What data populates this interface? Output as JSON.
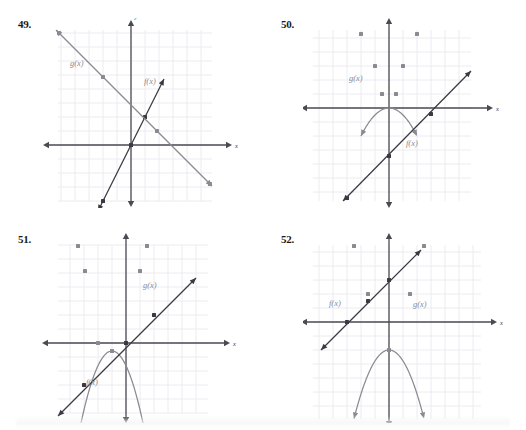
{
  "page": {
    "background": "#ffffff",
    "grid_color": "#eceaf0",
    "axis_color": "#4a4a52",
    "curve_dark": "#3a3a42",
    "curve_gray": "#8a8a92",
    "label_color": "#8a8a92",
    "number_color": "#1a1a1a"
  },
  "panels": [
    {
      "id": "panel-49",
      "number": "49.",
      "number_pos": {
        "x": 18,
        "y": 18
      },
      "graph_pos": {
        "x": 40,
        "y": 18
      },
      "graph_size": {
        "w": 200,
        "h": 190
      },
      "axis": {
        "x_label": "x",
        "y_label": "y",
        "origin": {
          "x": 91,
          "y": 127
        },
        "cell": 14,
        "grid": {
          "left": 18,
          "right": 172,
          "top": 12,
          "bottom": 183
        },
        "x_axis": {
          "x1": 7,
          "x2": 188,
          "y": 127
        },
        "y_axis": {
          "y1": 6,
          "y2": 185,
          "x": 91
        }
      },
      "curves": [
        {
          "name": "f(x)",
          "type": "line",
          "color": "#3a3a42",
          "label_pos": {
            "x": 104,
            "y": 66
          },
          "points_data": [
            [
              -2,
              -4
            ],
            [
              -1,
              -2
            ],
            [
              0,
              0
            ],
            [
              1,
              2
            ],
            [
              2,
              4
            ]
          ],
          "plot_points": [
            [
              63,
              183
            ],
            [
              77,
              155
            ],
            [
              91,
              127
            ],
            [
              105,
              99
            ],
            [
              119,
              71
            ]
          ],
          "arrow_start": [
            58,
            193
          ],
          "arrow_end": [
            124,
            61
          ],
          "markers": [
            [
              63,
              183
            ],
            [
              91,
              127
            ],
            [
              105,
              99
            ]
          ]
        },
        {
          "name": "g(x)",
          "type": "line",
          "color": "#8a8a92",
          "label_pos": {
            "x": 30,
            "y": 48
          },
          "points_data": [
            [
              -4,
              4
            ],
            [
              -2,
              2
            ],
            [
              0,
              0
            ],
            [
              2,
              -2
            ],
            [
              4,
              -4
            ]
          ],
          "plot_points": [
            [
              19,
              15
            ],
            [
              47,
              43
            ],
            [
              75,
              71
            ],
            [
              103,
              99
            ],
            [
              159,
              155
            ]
          ],
          "arrow_start": [
            16,
            12
          ],
          "arrow_end": [
            172,
            168
          ],
          "markers": [
            [
              19,
              15
            ],
            [
              63,
              59
            ],
            [
              117,
              113
            ],
            [
              170,
              166
            ]
          ]
        }
      ]
    },
    {
      "id": "panel-50",
      "number": "50.",
      "number_pos": {
        "x": 281,
        "y": 18
      },
      "graph_pos": {
        "x": 303,
        "y": 18
      },
      "graph_size": {
        "w": 200,
        "h": 190
      },
      "axis": {
        "x_label": "x",
        "y_label": "y",
        "origin": {
          "x": 86,
          "y": 90
        },
        "cell": 14,
        "grid": {
          "left": 10,
          "right": 168,
          "top": 12,
          "bottom": 183
        },
        "x_axis": {
          "x1": 2,
          "x2": 186,
          "y": 90
        },
        "y_axis": {
          "y1": 4,
          "y2": 186,
          "x": 86
        }
      },
      "curves": [
        {
          "name": "g(x)",
          "type": "parabola",
          "color": "#8a8a92",
          "label_pos": {
            "x": 46,
            "y": 63
          },
          "vertex": [
            86,
            90
          ],
          "a_pixels": 0.0357,
          "x_from": 58,
          "x_to": 114,
          "label_text": "g(x)",
          "markers": [
            [
              58,
              16
            ],
            [
              72,
              48
            ],
            [
              79,
              76
            ],
            [
              93,
              76
            ],
            [
              100,
              48
            ],
            [
              114,
              16
            ]
          ]
        },
        {
          "name": "f(x)",
          "type": "line",
          "color": "#3a3a42",
          "label_pos": {
            "x": 103,
            "y": 128
          },
          "points_data": [
            [
              -3,
              -3
            ],
            [
              0,
              0
            ],
            [
              2,
              2
            ]
          ],
          "plot_points": [
            [
              44,
              180
            ],
            [
              86,
              104
            ],
            [
              128,
              62
            ]
          ],
          "arrow_start": [
            40,
            183
          ],
          "arrow_end": [
            168,
            53
          ],
          "markers": [
            [
              44,
              180
            ],
            [
              86,
              138
            ],
            [
              128,
              96
            ]
          ]
        }
      ]
    },
    {
      "id": "panel-51",
      "number": "51.",
      "number_pos": {
        "x": 18,
        "y": 233
      },
      "graph_pos": {
        "x": 40,
        "y": 233
      },
      "graph_size": {
        "w": 200,
        "h": 190
      },
      "axis": {
        "x_label": "x",
        "y_label": "y",
        "origin": {
          "x": 86,
          "y": 110
        },
        "cell": 14,
        "grid": {
          "left": 18,
          "right": 168,
          "top": 12,
          "bottom": 180
        },
        "x_axis": {
          "x1": 6,
          "x2": 186,
          "y": 110
        },
        "y_axis": {
          "y1": 4,
          "y2": 186,
          "x": 86
        }
      },
      "curves": [
        {
          "name": "g(x)",
          "type": "parabola",
          "color": "#8a8a92",
          "label_pos": {
            "x": 103,
            "y": 55
          },
          "vertex": [
            72,
            118
          ],
          "a_pixels": 0.075,
          "x_from": 38,
          "x_to": 107,
          "markers": [
            [
              38,
              13
            ],
            [
              45,
              38
            ],
            [
              58,
              110
            ],
            [
              72,
              118
            ],
            [
              86,
              110
            ],
            [
              100,
              38
            ],
            [
              107,
              13
            ]
          ]
        },
        {
          "name": "f(x)",
          "type": "line",
          "color": "#3a3a42",
          "label_pos": {
            "x": 46,
            "y": 152
          },
          "points_data": [
            [
              -3,
              -2
            ],
            [
              0,
              1
            ],
            [
              2,
              3
            ]
          ],
          "plot_points": [
            [
              24,
              180
            ],
            [
              58,
              138
            ],
            [
              100,
              82
            ]
          ],
          "arrow_start": [
            18,
            183
          ],
          "arrow_end": [
            156,
            45
          ],
          "markers": [
            [
              44,
              152
            ],
            [
              86,
              110
            ],
            [
              114,
              82
            ]
          ]
        }
      ]
    },
    {
      "id": "panel-52",
      "number": "52.",
      "number_pos": {
        "x": 281,
        "y": 233
      },
      "graph_pos": {
        "x": 303,
        "y": 233
      },
      "graph_size": {
        "w": 200,
        "h": 190
      },
      "axis": {
        "x_label": "x",
        "y_label": "y",
        "origin": {
          "x": 86,
          "y": 89
        },
        "cell": 14,
        "grid": {
          "left": 10,
          "right": 178,
          "top": 12,
          "bottom": 186
        },
        "x_axis": {
          "x1": 2,
          "x2": 190,
          "y": 89
        },
        "y_axis": {
          "y1": 4,
          "y2": 190,
          "x": 86
        }
      },
      "curves": [
        {
          "name": "g(x)",
          "type": "parabola",
          "color": "#8a8a92",
          "label_pos": {
            "x": 110,
            "y": 74
          },
          "vertex": [
            86,
            117
          ],
          "a_pixels": 0.056,
          "x_from": 51,
          "x_to": 121,
          "markers": [
            [
              51,
              13
            ],
            [
              65,
              61
            ],
            [
              86,
              117
            ],
            [
              107,
              61
            ],
            [
              121,
              13
            ]
          ]
        },
        {
          "name": "f(x)",
          "type": "line",
          "color": "#3a3a42",
          "label_pos": {
            "x": 26,
            "y": 73
          },
          "points_data": [
            [
              -3,
              0
            ],
            [
              0,
              2
            ],
            [
              2,
              4
            ]
          ],
          "plot_points": [
            [
              44,
              89
            ],
            [
              86,
              47
            ],
            [
              114,
              19
            ]
          ],
          "arrow_start": [
            18,
            117
          ],
          "arrow_end": [
            118,
            17
          ],
          "markers": [
            [
              44,
              89
            ],
            [
              65,
              68
            ],
            [
              86,
              47
            ]
          ]
        }
      ]
    }
  ],
  "chart_data": [
    {
      "type": "line",
      "title": "49.",
      "xlabel": "x",
      "ylabel": "y",
      "xlim": [
        -6,
        6
      ],
      "ylim": [
        -6,
        6
      ],
      "grid": true,
      "series": [
        {
          "name": "f(x)",
          "x": [
            -2,
            -1,
            0,
            1,
            2
          ],
          "values": [
            -4,
            -2,
            0,
            2,
            4
          ]
        },
        {
          "name": "g(x)",
          "x": [
            -5,
            -2,
            0,
            2,
            5
          ],
          "values": [
            5,
            2,
            0,
            -2,
            -5
          ]
        }
      ]
    },
    {
      "type": "line",
      "title": "50.",
      "xlabel": "x",
      "ylabel": "y",
      "xlim": [
        -6,
        6
      ],
      "ylim": [
        -6,
        6
      ],
      "grid": true,
      "series": [
        {
          "name": "g(x)",
          "x": [
            -2,
            -1,
            0,
            1,
            2
          ],
          "values": [
            4,
            1,
            0,
            1,
            4
          ]
        },
        {
          "name": "f(x)",
          "x": [
            -3,
            0,
            3
          ],
          "values": [
            -3,
            0,
            3
          ]
        }
      ]
    },
    {
      "type": "line",
      "title": "51.",
      "xlabel": "x",
      "ylabel": "y",
      "xlim": [
        -6,
        6
      ],
      "ylim": [
        -6,
        6
      ],
      "grid": true,
      "series": [
        {
          "name": "g(x)",
          "x": [
            -3,
            -2,
            -1,
            0,
            1
          ],
          "values": [
            4,
            1,
            0,
            0,
            4
          ]
        },
        {
          "name": "f(x)",
          "x": [
            -3,
            0,
            2
          ],
          "values": [
            -2,
            1,
            3
          ]
        }
      ]
    },
    {
      "type": "line",
      "title": "52.",
      "xlabel": "x",
      "ylabel": "y",
      "xlim": [
        -6,
        6
      ],
      "ylim": [
        -6,
        6
      ],
      "grid": true,
      "series": [
        {
          "name": "g(x)",
          "x": [
            -2.5,
            -1.5,
            0,
            1.5,
            2.5
          ],
          "values": [
            5,
            1,
            -2,
            1,
            5
          ]
        },
        {
          "name": "f(x)",
          "x": [
            -3,
            0,
            2
          ],
          "values": [
            0,
            2,
            4
          ]
        }
      ]
    }
  ]
}
